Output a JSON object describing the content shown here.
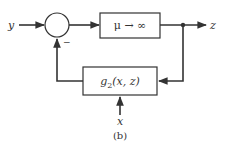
{
  "diagram": {
    "caption": "(b)",
    "input_label": "y",
    "output_label": "z",
    "side_input_label": "x",
    "junction_sign": "−",
    "forward_block": {
      "label": "μ → ∞"
    },
    "feedback_block": {
      "label_main": "g",
      "label_sub": "2",
      "label_args": "(x, z)"
    },
    "colors": {
      "line": "#333333",
      "background": "#ffffff"
    }
  }
}
